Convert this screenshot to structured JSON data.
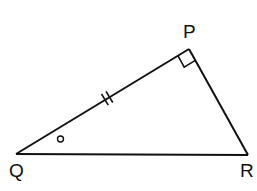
{
  "diagram": {
    "type": "right-triangle",
    "vertices": {
      "P": {
        "label": "P",
        "x": 189,
        "y": 49
      },
      "Q": {
        "label": "Q",
        "x": 16,
        "y": 154
      },
      "R": {
        "label": "R",
        "x": 248,
        "y": 155
      }
    },
    "labels": {
      "P": "P",
      "Q": "Q",
      "R": "R"
    },
    "markings": {
      "right_angle_at": "P",
      "equal_length_ticks_on": "PQ",
      "tick_count": 2,
      "angle_marker_at": "Q",
      "angle_marker_symbol": "small circle"
    },
    "colors": {
      "stroke": "#111111",
      "background": "#ffffff"
    }
  }
}
